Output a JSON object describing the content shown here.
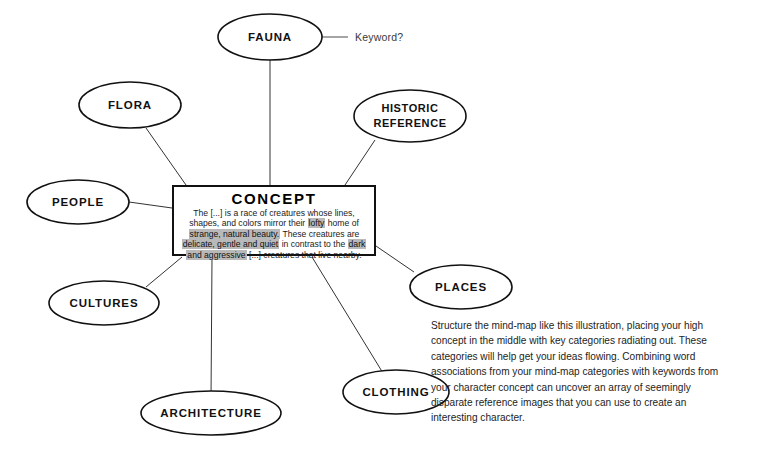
{
  "diagram": {
    "type": "mind-map",
    "center": {
      "title": "CONCEPT",
      "body_segments": [
        {
          "text": "The [...] is a race of creatures whose lines, shapes, and colors mirror their ",
          "highlight": false
        },
        {
          "text": "lofty",
          "highlight": true
        },
        {
          "text": " home of ",
          "highlight": false
        },
        {
          "text": "strange, natural beauty.",
          "highlight": true
        },
        {
          "text": " These creatures are ",
          "highlight": false
        },
        {
          "text": "delicate, gentle and quiet",
          "highlight": true
        },
        {
          "text": " in contrast to the ",
          "highlight": false
        },
        {
          "text": "dark and aggressive",
          "highlight": true
        },
        {
          "text": " [...] creatures that live nearby.",
          "highlight": false
        }
      ],
      "body_plain": "The [...] is a race of creatures whose lines, shapes, and colors mirror their lofty home of strange, natural beauty. These creatures are delicate, gentle and quiet in contrast to the dark and aggressive [...] creatures that live nearby."
    },
    "nodes": [
      {
        "id": "fauna",
        "label": "FAUNA",
        "lines": [
          "FAUNA"
        ]
      },
      {
        "id": "flora",
        "label": "FLORA",
        "lines": [
          "FLORA"
        ]
      },
      {
        "id": "historic-reference",
        "label": "HISTORIC REFERENCE",
        "lines": [
          "HISTORIC",
          "REFERENCE"
        ]
      },
      {
        "id": "people",
        "label": "PEOPLE",
        "lines": [
          "PEOPLE"
        ]
      },
      {
        "id": "places",
        "label": "PLACES",
        "lines": [
          "PLACES"
        ]
      },
      {
        "id": "cultures",
        "label": "CULTURES",
        "lines": [
          "CULTURES"
        ]
      },
      {
        "id": "clothing",
        "label": "CLOTHING",
        "lines": [
          "CLOTHING"
        ]
      },
      {
        "id": "architecture",
        "label": "ARCHITECTURE",
        "lines": [
          "ARCHITECTURE"
        ]
      }
    ],
    "annotation": {
      "label": "Keyword?"
    },
    "caption": "Structure the mind-map like this illustration, placing your high concept in the middle with key categories radiating out. These categories will help get your ideas flowing. Combining word associations from your mind-map categories with keywords from your character concept can uncover an array of seemingly disparate reference images that you can use to create an interesting character.",
    "colors": {
      "background": "#ffffff",
      "ink": "#111111",
      "connector": "#333333",
      "highlight": "#b9b9b9"
    }
  }
}
